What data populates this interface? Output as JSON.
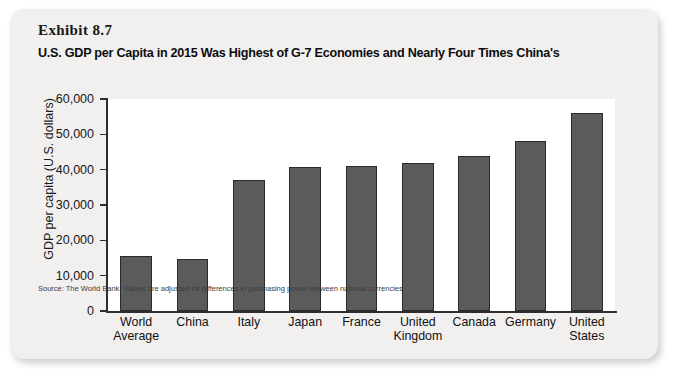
{
  "exhibit": {
    "label": "Exhibit 8.7",
    "title": "U.S. GDP per Capita in 2015 Was Highest of G-7 Economies and Nearly Four Times China's",
    "source_note": "Source: The World Bank. Values are adjusted for differences in purchasing power between national currencies."
  },
  "colors": {
    "card_background": "#f1f0ee",
    "plot_background": "#ffffff",
    "bar_fill": "#5b5b5b",
    "bar_border": "#2a2a2c",
    "axis": "#2e2e31",
    "text": "#111114"
  },
  "chart_data": {
    "type": "bar",
    "title": "U.S. GDP per Capita in 2015 Was Highest of G-7 Economies and Nearly Four Times China's",
    "xlabel": "",
    "ylabel": "GDP per capita (U.S. dollars)",
    "ylim": [
      0,
      60000
    ],
    "ytick_values": [
      0,
      10000,
      20000,
      30000,
      40000,
      50000,
      60000
    ],
    "ytick_labels": [
      "0",
      "10,000",
      "20,000",
      "30,000",
      "40,000",
      "50,000",
      "60,000"
    ],
    "grid": false,
    "legend": "none",
    "categories": [
      "World Average",
      "China",
      "Italy",
      "Japan",
      "France",
      "United Kingdom",
      "Canada",
      "Germany",
      "United States"
    ],
    "category_lines": [
      [
        "World",
        "Average"
      ],
      [
        "China",
        ""
      ],
      [
        "Italy",
        ""
      ],
      [
        "Japan",
        ""
      ],
      [
        "France",
        ""
      ],
      [
        "United",
        "Kingdom"
      ],
      [
        "Canada",
        ""
      ],
      [
        "Germany",
        ""
      ],
      [
        "United",
        "States"
      ]
    ],
    "values": [
      15600,
      14600,
      37100,
      40800,
      41000,
      41800,
      44000,
      48000,
      56100
    ]
  }
}
